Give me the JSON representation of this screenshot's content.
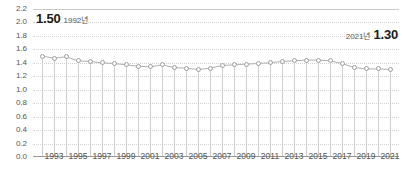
{
  "chart_data": {
    "type": "line",
    "title": "",
    "xlabel": "",
    "ylabel": "",
    "ylim": [
      0.0,
      2.2
    ],
    "ytick_step": 0.2,
    "grid": true,
    "legend": "none",
    "x": [
      1992,
      1993,
      1994,
      1995,
      1996,
      1997,
      1998,
      1999,
      2000,
      2001,
      2002,
      2003,
      2004,
      2005,
      2006,
      2007,
      2008,
      2009,
      2010,
      2011,
      2012,
      2013,
      2014,
      2015,
      2016,
      2017,
      2018,
      2019,
      2020,
      2021
    ],
    "values": [
      1.5,
      1.47,
      1.49,
      1.43,
      1.42,
      1.4,
      1.39,
      1.37,
      1.35,
      1.34,
      1.37,
      1.33,
      1.32,
      1.3,
      1.32,
      1.36,
      1.37,
      1.38,
      1.39,
      1.4,
      1.42,
      1.43,
      1.44,
      1.44,
      1.43,
      1.39,
      1.33,
      1.31,
      1.31,
      1.3
    ],
    "ytick_labels": [
      "2.2",
      "2.0",
      "1.8",
      "1.6",
      "1.4",
      "1.2",
      "1.0",
      "0.8",
      "0.6",
      "0.4",
      "0.2",
      "0.0"
    ],
    "ytick_values": [
      2.2,
      2.0,
      1.8,
      1.6,
      1.4,
      1.2,
      1.0,
      0.8,
      0.6,
      0.4,
      0.2,
      0.0
    ],
    "xtick_labels": [
      "1993",
      "1995",
      "1997",
      "1999",
      "2001",
      "2003",
      "2005",
      "2007",
      "2009",
      "2011",
      "2013",
      "2015",
      "2017",
      "2019",
      "2021"
    ],
    "xtick_values": [
      1993,
      1995,
      1997,
      1999,
      2001,
      2003,
      2005,
      2007,
      2009,
      2011,
      2013,
      2015,
      2017,
      2019,
      2021
    ],
    "annotations": [
      {
        "id": "start",
        "year_label": "1992년",
        "value_label": "1.50"
      },
      {
        "id": "end",
        "year_label": "2021년",
        "value_label": "1.30"
      }
    ],
    "colors": {
      "line": "#b0b0b0",
      "marker_stroke": "#9e9e9e",
      "marker_fill": "#ffffff",
      "grid": "#d3d3d3",
      "axis": "#9a9a9a",
      "text": "#555555",
      "annotation_text": "#1a1a1a"
    }
  }
}
